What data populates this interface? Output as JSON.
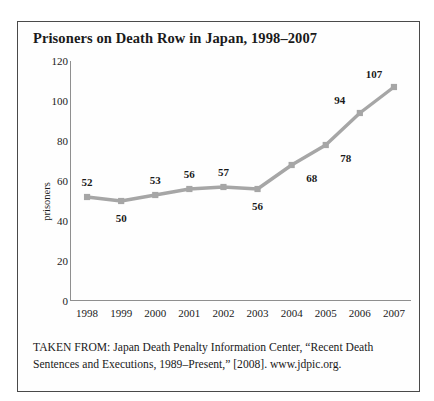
{
  "figure": {
    "title": "Prisoners on Death Row in Japan, 1998–2007",
    "source_line_1": "TAKEN FROM: Japan Death Penalty Information Center, “Recent Death",
    "source_line_2": "Sentences and Executions, 1989–Present,” [2008]. www.jdpic.org."
  },
  "chart_data": {
    "type": "line",
    "title": "Prisoners on Death Row in Japan, 1998–2007",
    "xlabel": "",
    "ylabel": "prisoners",
    "categories": [
      "1998",
      "1999",
      "2000",
      "2001",
      "2002",
      "2003",
      "2004",
      "2005",
      "2006",
      "2007"
    ],
    "values": [
      52,
      50,
      53,
      56,
      57,
      56,
      68,
      78,
      94,
      107
    ],
    "point_labels": [
      "52",
      "50",
      "53",
      "56",
      "57",
      "56",
      "68",
      "78",
      "94",
      "107"
    ],
    "label_positions": [
      "above",
      "below",
      "above",
      "above",
      "above",
      "below",
      "right-below",
      "right-below",
      "above-left",
      "above-left"
    ],
    "ylim": [
      0,
      120
    ],
    "yticks": [
      0,
      20,
      40,
      60,
      80,
      100,
      120
    ],
    "ytick_labels": [
      "0",
      "20",
      "40",
      "60",
      "80",
      "100",
      "120"
    ],
    "grid": false,
    "legend": false,
    "series_color": "#a6a6a6",
    "marker": "square",
    "axis_color": "#8f8f8f"
  }
}
